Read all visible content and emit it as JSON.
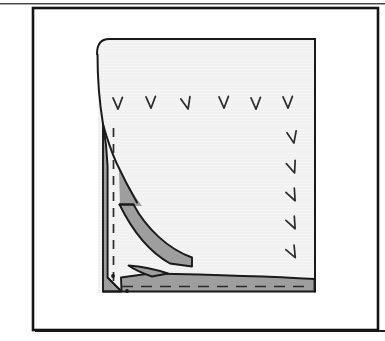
{
  "figure": {
    "kind": "scanned-technical-diagram",
    "page_artifact": {
      "top_rule": "thin horizontal scan line across page top",
      "bottom_rule": "thin horizontal scan line across page bottom"
    },
    "frame": {
      "name": "outer-figure-frame",
      "x": 33,
      "y": 8,
      "width": 345,
      "height": 322,
      "stroke": "#141414",
      "stroke_width": 2.6,
      "fill": "#ffffff"
    },
    "panel": {
      "name": "diagram-panel",
      "x": 97,
      "y": 38,
      "width": 219,
      "height": 256,
      "stroke": "#1a1a1a",
      "stroke_width": 2.0,
      "fill": "#f1f1f1",
      "note": "interior region is light grey, open along top-left where the curved free boundary cuts in"
    },
    "colors": {
      "ink": "#1a1a1a",
      "band_fill": "#9e9e9e",
      "panel_fill": "#f1f1f1",
      "page": "#ffffff",
      "frame": "#141414",
      "dash": "#2a2a2a"
    },
    "regions": [
      {
        "name": "boundary-band-left-bottom",
        "role": "shaded L-shaped boundary band along left and bottom edges",
        "fill": "#9e9e9e",
        "stroke": "#1a1a1a"
      },
      {
        "name": "curved-separation-tail",
        "role": "tapering curved band sweeping from the left band toward lower right",
        "fill": "#9e9e9e",
        "stroke": "#1a1a1a"
      },
      {
        "name": "lower-sliver-tail",
        "role": "thin pointed sliver above the bottom band",
        "fill": "#9e9e9e",
        "stroke": "#1a1a1a"
      },
      {
        "name": "free-boundary-curve",
        "role": "curved free surface cutting the upper-left corner of the panel",
        "stroke": "#1a1a1a"
      }
    ],
    "centerlines": [
      {
        "name": "vertical-dashed-centerline",
        "orientation": "vertical",
        "dash": "9 7"
      },
      {
        "name": "horizontal-dashed-centerline",
        "orientation": "horizontal",
        "dash": "11 8"
      }
    ],
    "corner_nodes": [
      {
        "name": "corner-node-upper",
        "cx": 113,
        "cy": 276,
        "r": 1.9
      },
      {
        "name": "corner-node-lower",
        "cx": 127,
        "cy": 291,
        "r": 1.9
      }
    ],
    "tick_marks": {
      "glyph": "V",
      "description": "small V-shaped direction marks",
      "top_row": [
        {
          "name": "tick-top-1",
          "x": 118,
          "y": 104,
          "rot": 0
        },
        {
          "name": "tick-top-2",
          "x": 151,
          "y": 103,
          "rot": 0
        },
        {
          "name": "tick-top-3",
          "x": 187,
          "y": 104,
          "rot": -12
        },
        {
          "name": "tick-top-4",
          "x": 224,
          "y": 103,
          "rot": 0
        },
        {
          "name": "tick-top-5",
          "x": 256,
          "y": 104,
          "rot": 0
        },
        {
          "name": "tick-top-6",
          "x": 288,
          "y": 103,
          "rot": 0
        }
      ],
      "right_column": [
        {
          "name": "tick-right-1",
          "x": 293,
          "y": 138,
          "rot": -10
        },
        {
          "name": "tick-right-2",
          "x": 293,
          "y": 168,
          "rot": -18
        },
        {
          "name": "tick-right-3",
          "x": 293,
          "y": 196,
          "rot": -24
        },
        {
          "name": "tick-right-4",
          "x": 293,
          "y": 224,
          "rot": -24
        },
        {
          "name": "tick-right-5",
          "x": 293,
          "y": 253,
          "rot": -26
        }
      ]
    }
  }
}
